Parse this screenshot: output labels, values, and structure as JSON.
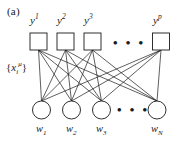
{
  "figure": {
    "panel_label": "(a)",
    "type": "bipartite-network-diagram",
    "background_color": "#ffffff",
    "stroke_color": "#1a1a1a"
  },
  "top_layer": {
    "node_shape": "square",
    "count_shown": 4,
    "ellipsis": "• • •",
    "nodes": [
      {
        "label_base": "y",
        "superscript": "1",
        "cx": 38.5,
        "cy": 41.5
      },
      {
        "label_base": "y",
        "superscript": "2",
        "cx": 65.5,
        "cy": 41.5
      },
      {
        "label_base": "y",
        "superscript": "3",
        "cx": 92.5,
        "cy": 41.5
      },
      {
        "label_base": "y",
        "superscript": "p",
        "cx": 161.0,
        "cy": 41.5
      }
    ]
  },
  "bottom_layer": {
    "node_shape": "circle",
    "count_shown": 4,
    "ellipsis": "• • •",
    "nodes": [
      {
        "label_base": "w",
        "subscript": "1",
        "cx": 41.5,
        "cy": 110.0
      },
      {
        "label_base": "w",
        "subscript": "2",
        "cx": 71.5,
        "cy": 110.0
      },
      {
        "label_base": "w",
        "subscript": "3",
        "cx": 101.5,
        "cy": 110.0
      },
      {
        "label_base": "w",
        "subscript": "N",
        "cx": 157.0,
        "cy": 110.0
      }
    ]
  },
  "side_label": {
    "text_open": "{",
    "symbol": "x",
    "subscript": "i",
    "superscript": "μ",
    "text_close": "}"
  },
  "edges": {
    "pattern": "fully-connected-bipartite",
    "description": "every top square node connects to every bottom circle node"
  }
}
